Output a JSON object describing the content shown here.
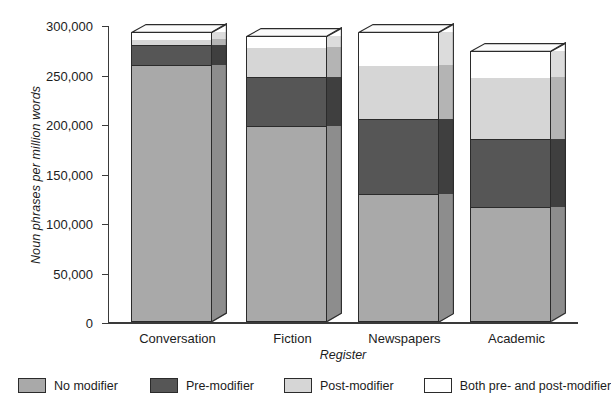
{
  "chart_data": {
    "type": "bar",
    "subtype": "stacked-bar-3d",
    "title": "",
    "xlabel": "Register",
    "ylabel": "Noun phrases per million words",
    "categories": [
      "Conversation",
      "Fiction",
      "Newspapers",
      "Academic"
    ],
    "series": [
      {
        "name": "No modifier",
        "color": "#a9a9a9",
        "values": [
          259600,
          198000,
          129300,
          116200
        ]
      },
      {
        "name": "Pre-modifier",
        "color": "#565656",
        "values": [
          20200,
          49500,
          76400,
          68600
        ]
      },
      {
        "name": "Post-modifier",
        "color": "#d6d6d6",
        "values": [
          6100,
          30300,
          54500,
          62600
        ]
      },
      {
        "name": "Both pre- and post-modifier",
        "color": "#ffffff",
        "values": [
          7100,
          11200,
          33400,
          26300
        ]
      }
    ],
    "totals": [
      293000,
      289000,
      293600,
      273700
    ],
    "ylim": [
      0,
      300000
    ],
    "yticks": [
      0,
      50000,
      100000,
      150000,
      200000,
      250000,
      300000
    ],
    "ytick_labels": [
      "0",
      "50,000",
      "100,000",
      "150,000",
      "200,000",
      "250,000",
      "300,000"
    ],
    "grid": false,
    "legend_position": "bottom"
  },
  "legend": {
    "items": [
      {
        "label": "No modifier",
        "color": "#a9a9a9"
      },
      {
        "label": "Pre-modifier",
        "color": "#565656"
      },
      {
        "label": "Post-modifier",
        "color": "#d6d6d6"
      },
      {
        "label": "Both pre- and post-modifier",
        "color": "#ffffff"
      }
    ]
  }
}
